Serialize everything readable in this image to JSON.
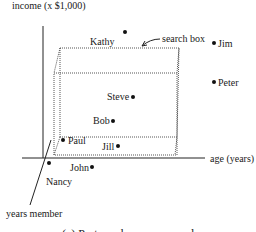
{
  "diagram": {
    "axes": {
      "y_label": "income (x $1,000)",
      "x_label": "age (years)",
      "z_label": "years member"
    },
    "search_box_label": "search box",
    "caption": "(a) Partner shown as records",
    "points": [
      {
        "name": "Kathy",
        "label": "Kathy"
      },
      {
        "name": "Jim",
        "label": "Jim"
      },
      {
        "name": "Peter",
        "label": "Peter"
      },
      {
        "name": "Steve",
        "label": "Steve"
      },
      {
        "name": "Bob",
        "label": "Bob"
      },
      {
        "name": "Paul",
        "label": "Paul"
      },
      {
        "name": "Jill",
        "label": "Jill"
      },
      {
        "name": "John",
        "label": "John"
      },
      {
        "name": "Nancy",
        "label": "Nancy"
      }
    ]
  }
}
